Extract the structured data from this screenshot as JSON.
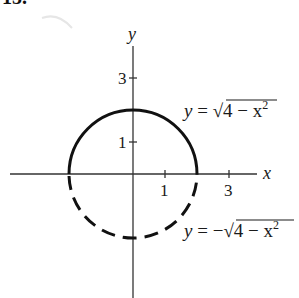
{
  "problem_number": "15.",
  "diagram": {
    "axes": {
      "x_label": "x",
      "y_label": "y",
      "x_ticks": [
        {
          "value": 1,
          "label": "1"
        },
        {
          "value": 3,
          "label": "3"
        }
      ],
      "y_ticks": [
        {
          "value": 1,
          "label": "1"
        },
        {
          "value": 3,
          "label": "3"
        }
      ]
    },
    "curves": [
      {
        "name": "upper-semicircle",
        "style": "solid",
        "equation": {
          "lhs": "y",
          "eq": " = ",
          "sign": "",
          "radicand": "4 − x",
          "exp": "2"
        }
      },
      {
        "name": "lower-semicircle",
        "style": "dashed",
        "equation": {
          "lhs": "y",
          "eq": " = ",
          "sign": "−",
          "radicand": "4 − x",
          "exp": "2"
        }
      }
    ],
    "radius": 2,
    "colors": {
      "ink": "#1a1a1a",
      "axis": "#333333"
    }
  }
}
